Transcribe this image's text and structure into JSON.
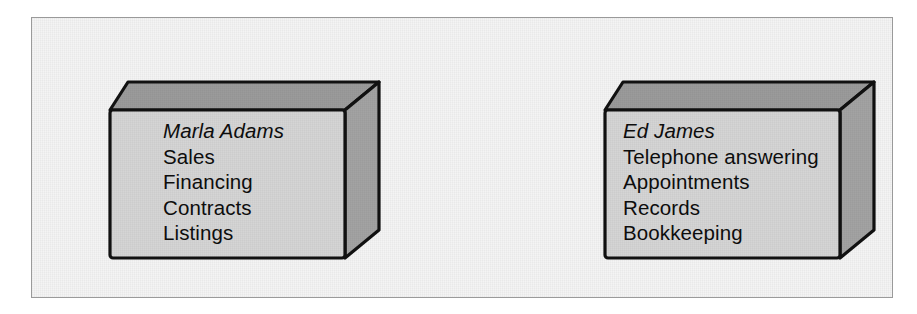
{
  "figure": {
    "type": "org-responsibility-boxes",
    "frame": {
      "border_color": "#9a9a9a",
      "fill_color": "#f4f4f4"
    },
    "box_colors": {
      "front_face": "#d5d5d5",
      "top_face": "#9b9b9b",
      "side_face": "#a3a3a3",
      "outline": "#111111"
    },
    "boxes": [
      {
        "id": "marla-adams",
        "person": "Marla Adams",
        "duties": [
          "Sales",
          "Financing",
          "Contracts",
          "Listings"
        ]
      },
      {
        "id": "ed-james",
        "person": "Ed James",
        "duties": [
          "Telephone answering",
          "Appointments",
          "Records",
          "Bookkeeping"
        ]
      }
    ]
  }
}
